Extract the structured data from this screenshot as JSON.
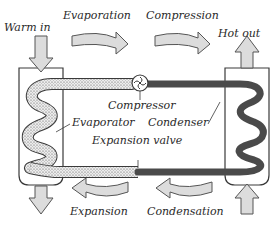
{
  "diagram": {
    "labels": {
      "warm_in": "Warm in",
      "hot_out": "Hot out",
      "evaporation": "Evaporation",
      "compression": "Compression",
      "expansion": "Expansion",
      "condensation": "Condensation",
      "compressor": "Compressor",
      "evaporator": "Evaporator",
      "condenser": "Condenser",
      "expansion_valve": "Expansion valve"
    },
    "colors": {
      "outline": "#3a3a3a",
      "arrow_fill": "#dcdcdc",
      "condenser_coil": "#4a4a4a",
      "evaporator_coil": "#e6e6e6",
      "background": "#ffffff"
    }
  }
}
